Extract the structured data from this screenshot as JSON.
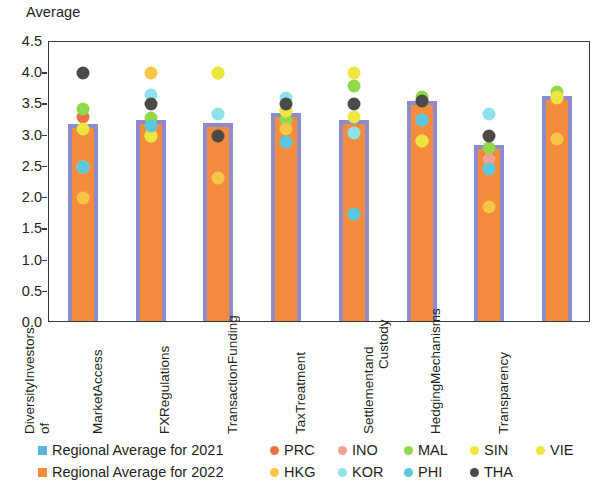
{
  "chart_data": {
    "type": "bar",
    "title": "",
    "ylabel": "Average",
    "xlabel": "",
    "ylim": [
      0.0,
      4.5
    ],
    "ytick_labels": [
      "4.5",
      "4.0",
      "3.5",
      "3.0",
      "2.5",
      "2.0",
      "1.5",
      "1.0",
      "0.5",
      "0.0"
    ],
    "ytick_values": [
      4.5,
      4.0,
      3.5,
      3.0,
      2.5,
      2.0,
      1.5,
      1.0,
      0.5,
      0.0
    ],
    "grid": false,
    "legend_position": "bottom",
    "categories": [
      "Diversity of Investors",
      "Market Access",
      "FX Regulations",
      "Transaction Funding",
      "Tax Treatment",
      "Settlement and Custody",
      "Hedging Mechanisms",
      "Transparency"
    ],
    "category_lines": [
      [
        "Diversity of",
        "Investors"
      ],
      [
        "Market",
        "Access"
      ],
      [
        "FX",
        "Regulations"
      ],
      [
        "Transaction",
        "Funding"
      ],
      [
        "Tax",
        "Treatment"
      ],
      [
        "Settlement",
        "and Custody"
      ],
      [
        "Hedging",
        "Mechanisms"
      ],
      [
        "Transparency"
      ]
    ],
    "series": [
      {
        "name": "Regional Average for 2021",
        "key": "avg2021",
        "kind": "bar-outline",
        "color": "#8c8ccc",
        "values": [
          3.15,
          3.22,
          3.17,
          3.33,
          3.22,
          3.53,
          2.82,
          3.6
        ]
      },
      {
        "name": "Regional Average for 2022",
        "key": "avg2022",
        "kind": "bar-fill",
        "color": "#f58b3c",
        "values": [
          3.12,
          3.2,
          3.15,
          3.3,
          3.2,
          3.51,
          2.8,
          3.57
        ]
      },
      {
        "name": "PRC",
        "key": "PRC",
        "kind": "dot",
        "color": "#ee7046",
        "values": [
          3.3,
          null,
          null,
          null,
          null,
          null,
          2.67,
          null
        ]
      },
      {
        "name": "INO",
        "key": "INO",
        "kind": "dot",
        "color": "#f5a08a",
        "values": [
          null,
          null,
          null,
          null,
          null,
          null,
          2.62,
          null
        ]
      },
      {
        "name": "MAL",
        "key": "MAL",
        "kind": "dot",
        "color": "#8fd94a",
        "values": [
          3.42,
          3.28,
          null,
          3.25,
          3.8,
          3.62,
          2.8,
          3.7
        ]
      },
      {
        "name": "SIN",
        "key": "SIN",
        "kind": "dot",
        "color": "#ece63f",
        "values": [
          3.1,
          3.0,
          4.0,
          3.4,
          4.0,
          2.92,
          null,
          3.62
        ]
      },
      {
        "name": "VIE",
        "key": "VIE",
        "kind": "dot",
        "color": "#ece63f",
        "values": [
          2.5,
          3.0,
          4.0,
          3.4,
          3.3,
          2.92,
          null,
          3.6
        ]
      },
      {
        "name": "HKG",
        "key": "HKG",
        "kind": "dot",
        "color": "#f7c648",
        "values": [
          2.0,
          4.0,
          2.33,
          3.1,
          null,
          null,
          1.85,
          2.95
        ]
      },
      {
        "name": "KOR",
        "key": "KOR",
        "kind": "dot",
        "color": "#8fe3e8",
        "values": [
          2.5,
          3.65,
          3.35,
          3.6,
          3.05,
          3.25,
          3.35,
          null
        ]
      },
      {
        "name": "PHI",
        "key": "PHI",
        "kind": "dot",
        "color": "#5cc8e0",
        "values": [
          2.5,
          3.15,
          null,
          2.9,
          1.75,
          3.25,
          2.47,
          null
        ]
      },
      {
        "name": "THA",
        "key": "THA",
        "kind": "dot",
        "color": "#4a4a4a",
        "values": [
          4.0,
          3.5,
          3.0,
          3.5,
          3.5,
          3.55,
          3.0,
          null
        ]
      }
    ]
  },
  "legend": {
    "row1": [
      {
        "label": "Regional Average for 2021",
        "marker": "square",
        "color": "#5cb3dd"
      },
      {
        "label": "PRC",
        "marker": "circle",
        "color": "#ee7046"
      },
      {
        "label": "INO",
        "marker": "circle",
        "color": "#f5a08a"
      },
      {
        "label": "MAL",
        "marker": "circle",
        "color": "#8fd94a"
      },
      {
        "label": "SIN",
        "marker": "circle",
        "color": "#ece63f"
      },
      {
        "label": "VIE",
        "marker": "circle",
        "color": "#ece63f"
      }
    ],
    "row2": [
      {
        "label": "Regional Average for 2022",
        "marker": "square",
        "color": "#f58b3c"
      },
      {
        "label": "HKG",
        "marker": "circle",
        "color": "#f7c648"
      },
      {
        "label": "KOR",
        "marker": "circle",
        "color": "#8fe3e8"
      },
      {
        "label": "PHI",
        "marker": "circle",
        "color": "#5cc8e0"
      },
      {
        "label": "THA",
        "marker": "circle",
        "color": "#4a4a4a"
      }
    ]
  }
}
